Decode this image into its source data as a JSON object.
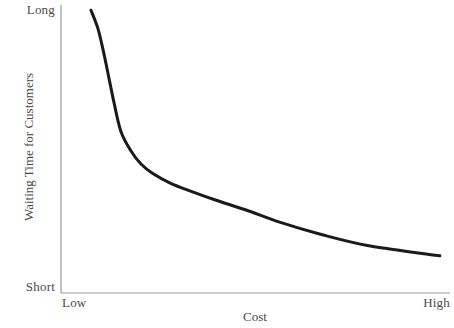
{
  "chart_data": {
    "type": "line",
    "title": "",
    "xlabel": "Cost",
    "ylabel": "Waiting Time for Customers",
    "x_tick_labels": [
      "Low",
      "High"
    ],
    "y_tick_labels": [
      "Short",
      "Long"
    ],
    "xlim": [
      0,
      1
    ],
    "ylim": [
      0,
      1
    ],
    "grid": false,
    "legend": null,
    "annotations": [],
    "series": [
      {
        "name": "waiting-time-vs-cost",
        "color": "#1a1a1a",
        "line_width": 3,
        "points": [
          {
            "x": 0.077,
            "y": 0.982
          },
          {
            "x": 0.095,
            "y": 0.918
          },
          {
            "x": 0.11,
            "y": 0.833
          },
          {
            "x": 0.123,
            "y": 0.748
          },
          {
            "x": 0.136,
            "y": 0.663
          },
          {
            "x": 0.154,
            "y": 0.561
          },
          {
            "x": 0.18,
            "y": 0.493
          },
          {
            "x": 0.205,
            "y": 0.449
          },
          {
            "x": 0.236,
            "y": 0.415
          },
          {
            "x": 0.282,
            "y": 0.381
          },
          {
            "x": 0.333,
            "y": 0.354
          },
          {
            "x": 0.397,
            "y": 0.323
          },
          {
            "x": 0.474,
            "y": 0.289
          },
          {
            "x": 0.564,
            "y": 0.245
          },
          {
            "x": 0.667,
            "y": 0.204
          },
          {
            "x": 0.795,
            "y": 0.163
          },
          {
            "x": 0.974,
            "y": 0.129
          }
        ]
      }
    ]
  },
  "axes": {
    "y_tip_high_label": "Long",
    "y_tip_low_label": "Short",
    "x_tip_low_label": "Low",
    "x_tip_high_label": "High",
    "x_title": "Cost",
    "y_title": "Waiting Time for Customers",
    "axis_color": "#9a9a9a",
    "curve_color": "#1a1a1a",
    "background_color": "#ffffff"
  }
}
